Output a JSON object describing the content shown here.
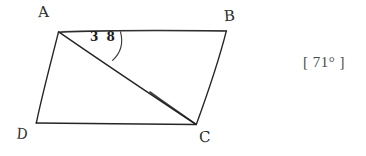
{
  "figure": {
    "kind": "hand-drawn-parallelogram-with-diagonal",
    "background_color": "#ffffff",
    "stroke_color": "#262626",
    "vertices": [
      {
        "name": "A",
        "label": "A",
        "x": 59,
        "y": 31
      },
      {
        "name": "B",
        "label": "B",
        "x": 226,
        "y": 31
      },
      {
        "name": "C",
        "label": "C",
        "x": 196,
        "y": 124
      },
      {
        "name": "D",
        "label": "D",
        "x": 36,
        "y": 123
      }
    ],
    "edges": [
      {
        "name": "AB",
        "from": "A",
        "to": "B"
      },
      {
        "name": "BC",
        "from": "B",
        "to": "C"
      },
      {
        "name": "CD",
        "from": "C",
        "to": "D"
      },
      {
        "name": "DA",
        "from": "D",
        "to": "A"
      }
    ],
    "diagonal": {
      "name": "AC",
      "from": "A",
      "to": "C"
    },
    "angle_marks": [
      {
        "name": "angle-BAC",
        "at_vertex": "A",
        "between": [
          "AC",
          "AB"
        ],
        "value_label": "3 8",
        "value": 38,
        "unit": "degrees",
        "arc_radius": 30
      }
    ]
  },
  "answer": {
    "text": "[ 71° ]",
    "value": 71,
    "unit": "degrees",
    "color": "#4a4a4a"
  }
}
